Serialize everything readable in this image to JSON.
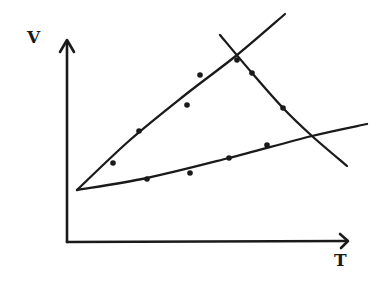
{
  "chart_data": {
    "type": "scatter",
    "title": "",
    "xlabel": "T",
    "ylabel": "V",
    "style": "hand-drawn sketch, no ticks, no gridlines, no legend",
    "grid": false,
    "legend": null,
    "axis_ticks": [],
    "pixel_axes": {
      "origin": [
        67,
        242
      ],
      "x_end": [
        348,
        242
      ],
      "y_end": [
        67,
        40
      ]
    },
    "series": [
      {
        "name": "upper-branch",
        "kind": "fit-line-with-points",
        "line": [
          [
            77,
            190
          ],
          [
            130,
            140
          ],
          [
            185,
            95
          ],
          [
            237,
            55
          ],
          [
            285,
            14
          ]
        ],
        "points": [
          [
            113,
            163
          ],
          [
            139,
            131
          ],
          [
            187,
            105
          ],
          [
            200,
            75
          ],
          [
            237,
            60
          ]
        ]
      },
      {
        "name": "descending-branch",
        "kind": "fit-line-with-points",
        "line": [
          [
            220,
            35
          ],
          [
            252,
            73
          ],
          [
            283,
            108
          ],
          [
            312,
            136
          ],
          [
            347,
            166
          ]
        ],
        "points": [
          [
            252,
            73
          ],
          [
            283,
            108
          ]
        ]
      },
      {
        "name": "lower-branch",
        "kind": "fit-line-with-points",
        "line": [
          [
            77,
            190
          ],
          [
            147,
            178
          ],
          [
            229,
            158
          ],
          [
            312,
            136
          ],
          [
            367,
            124
          ]
        ],
        "points": [
          [
            147,
            179
          ],
          [
            190,
            173
          ],
          [
            229,
            158
          ],
          [
            267,
            145
          ]
        ]
      }
    ],
    "annotations": [
      {
        "label": "intersection-upper-descending",
        "at": [
          237,
          58
        ]
      },
      {
        "label": "intersection-lower-descending",
        "at": [
          312,
          136
        ]
      }
    ]
  },
  "colors": {
    "ink": "#1a1a1a",
    "background": "#ffffff"
  }
}
